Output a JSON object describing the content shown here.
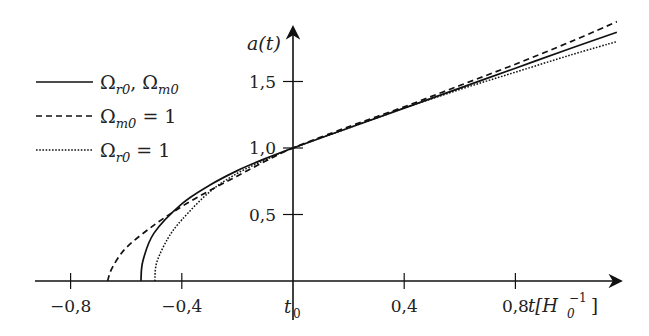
{
  "chart_data": {
    "type": "line",
    "title": "",
    "xlabel": "t[H0^-1]",
    "ylabel": "a(t)",
    "xlim": [
      -0.93,
      1.2
    ],
    "ylim": [
      0,
      1.87
    ],
    "x_ticks": [
      {
        "value": -0.8,
        "label": "−0,8"
      },
      {
        "value": -0.4,
        "label": "−0,4"
      },
      {
        "value": 0.0,
        "label": "t0"
      },
      {
        "value": 0.4,
        "label": "0,4"
      },
      {
        "value": 0.8,
        "label": "0,8"
      }
    ],
    "y_ticks": [
      {
        "value": 0.5,
        "label": "0,5"
      },
      {
        "value": 1.0,
        "label": "1,0"
      },
      {
        "value": 1.5,
        "label": "1,5"
      }
    ],
    "grid": false,
    "legend_position": "upper-left",
    "series": [
      {
        "name": "Ω_r0, Ω_m0",
        "style": "solid",
        "x": [
          -0.547,
          -0.54,
          -0.5,
          -0.4,
          -0.3,
          -0.2,
          -0.1,
          0.0,
          0.2,
          0.4,
          0.6,
          0.8,
          1.0,
          1.165
        ],
        "y": [
          0.0,
          0.15,
          0.36,
          0.58,
          0.72,
          0.83,
          0.92,
          1.0,
          1.15,
          1.3,
          1.45,
          1.6,
          1.75,
          1.87
        ]
      },
      {
        "name": "Ω_m0 = 1",
        "style": "dashed",
        "x": [
          -0.667,
          -0.65,
          -0.6,
          -0.5,
          -0.4,
          -0.3,
          -0.2,
          -0.1,
          0.0,
          0.2,
          0.4,
          0.6,
          0.8,
          1.0,
          1.165
        ],
        "y": [
          0.0,
          0.1,
          0.25,
          0.42,
          0.56,
          0.68,
          0.79,
          0.9,
          1.0,
          1.16,
          1.31,
          1.47,
          1.63,
          1.8,
          1.95
        ]
      },
      {
        "name": "Ω_r0 = 1",
        "style": "dotted",
        "x": [
          -0.497,
          -0.49,
          -0.45,
          -0.4,
          -0.3,
          -0.2,
          -0.1,
          0.0,
          0.2,
          0.4,
          0.6,
          0.8,
          1.0,
          1.165
        ],
        "y": [
          0.0,
          0.14,
          0.32,
          0.46,
          0.67,
          0.81,
          0.91,
          1.0,
          1.15,
          1.3,
          1.44,
          1.57,
          1.7,
          1.8
        ]
      }
    ]
  },
  "legend": {
    "items": [
      {
        "label": "Ω",
        "sub": "r0",
        "rest": ", Ω",
        "sub2": "m0",
        "style": "solid"
      },
      {
        "label": "Ω",
        "sub": "m0",
        "rest": " = 1",
        "sub2": "",
        "style": "dashed"
      },
      {
        "label": "Ω",
        "sub": "r0",
        "rest": " = 1",
        "sub2": "",
        "style": "dotted"
      }
    ]
  },
  "axes": {
    "y_label_main": "a(t)",
    "x_label_t": "t[H",
    "x_label_sub": "0",
    "x_label_sup": "−1",
    "x_label_close": "]",
    "t0_main": "t",
    "t0_sub": "0"
  },
  "colors": {
    "ink": "#111111",
    "background": "#ffffff"
  }
}
